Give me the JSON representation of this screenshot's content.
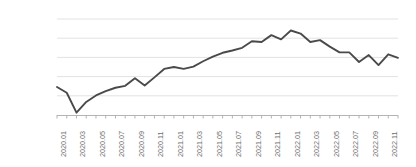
{
  "chart_data": {
    "type": "line",
    "title": "",
    "subtitle": "",
    "xlabel": "",
    "ylabel": "",
    "ylim": [
      2500,
      5000
    ],
    "ytick_labels": [
      "5,000pt",
      "4,500pt",
      "4,000pt",
      "3,500pt",
      "3,000pt",
      "2,500pt"
    ],
    "ytick_values": [
      5000,
      4500,
      4000,
      3500,
      3000,
      2500
    ],
    "grid": true,
    "legend": false,
    "legend_position": "none",
    "line_color": "#4a4a4a",
    "grid_color": "#e2e2e2",
    "axis_color": "#b4b4b4",
    "tick_label_color": "#6e6e6e",
    "x": [
      "2020.01",
      "2020.02",
      "2020.03",
      "2020.04",
      "2020.05",
      "2020.06",
      "2020.07",
      "2020.08",
      "2020.09",
      "2020.10",
      "2020.11",
      "2020.12",
      "2021.01",
      "2021.02",
      "2021.03",
      "2021.04",
      "2021.05",
      "2021.06",
      "2021.07",
      "2021.08",
      "2021.09",
      "2021.10",
      "2021.11",
      "2021.12",
      "2022.01",
      "2022.02",
      "2022.03",
      "2022.04",
      "2022.05",
      "2022.06",
      "2022.07",
      "2022.08",
      "2022.09",
      "2022.10",
      "2022.11",
      "2022.12"
    ],
    "xtick_labels": [
      "2020.01",
      "2020.03",
      "2020.05",
      "2020.07",
      "2020.09",
      "2020.11",
      "2021.01",
      "2021.03",
      "2021.05",
      "2021.07",
      "2021.09",
      "2021.11",
      "2022.01",
      "2022.03",
      "2022.05",
      "2022.07",
      "2022.09",
      "2022.11"
    ],
    "xtick_indices": [
      0,
      2,
      4,
      6,
      8,
      10,
      12,
      14,
      16,
      18,
      20,
      22,
      24,
      26,
      28,
      30,
      32,
      34
    ],
    "values": [
      3230,
      3080,
      2560,
      2840,
      3010,
      3120,
      3210,
      3260,
      3460,
      3270,
      3480,
      3700,
      3750,
      3700,
      3760,
      3900,
      4020,
      4120,
      4180,
      4250,
      4420,
      4400,
      4580,
      4470,
      4700,
      4620,
      4400,
      4450,
      4280,
      4130,
      4130,
      3880,
      4060,
      3800,
      4080,
      3990
    ],
    "series": [
      {
        "name": "",
        "values": [
          3230,
          3080,
          2560,
          2840,
          3010,
          3120,
          3210,
          3260,
          3460,
          3270,
          3480,
          3700,
          3750,
          3700,
          3760,
          3900,
          4020,
          4120,
          4180,
          4250,
          4420,
          4400,
          4580,
          4470,
          4700,
          4620,
          4400,
          4450,
          4280,
          4130,
          4130,
          3880,
          4060,
          3800,
          4080,
          3990
        ]
      }
    ]
  }
}
